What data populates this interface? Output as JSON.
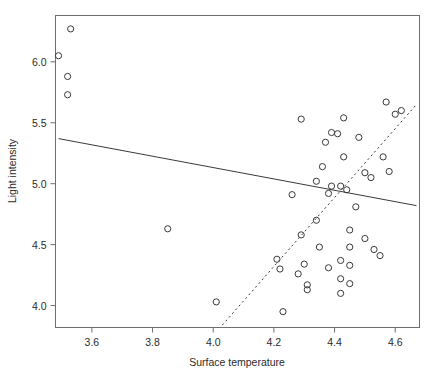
{
  "chart_data": {
    "type": "scatter",
    "title": "",
    "xlabel": "Surface temperature",
    "ylabel": "Light intensity",
    "xlim": [
      3.48,
      4.68
    ],
    "ylim": [
      3.82,
      6.38
    ],
    "xticks": [
      3.6,
      3.8,
      4.0,
      4.2,
      4.4,
      4.6
    ],
    "xtick_labels": [
      "3.6",
      "3.8",
      "4.0",
      "4.2",
      "4.4",
      "4.6"
    ],
    "yticks": [
      4.0,
      4.5,
      5.0,
      5.5,
      6.0
    ],
    "ytick_labels": [
      "4.0",
      "4.5",
      "5.0",
      "5.5",
      "6.0"
    ],
    "grid": false,
    "legend": null,
    "marker": "open-circle",
    "points": [
      {
        "x": 3.53,
        "y": 6.27
      },
      {
        "x": 3.49,
        "y": 6.05
      },
      {
        "x": 3.52,
        "y": 5.88
      },
      {
        "x": 3.52,
        "y": 5.73
      },
      {
        "x": 3.85,
        "y": 4.63
      },
      {
        "x": 4.01,
        "y": 4.03
      },
      {
        "x": 4.21,
        "y": 4.38
      },
      {
        "x": 4.22,
        "y": 4.3
      },
      {
        "x": 4.23,
        "y": 3.95
      },
      {
        "x": 4.26,
        "y": 4.91
      },
      {
        "x": 4.28,
        "y": 4.26
      },
      {
        "x": 4.29,
        "y": 5.53
      },
      {
        "x": 4.29,
        "y": 4.58
      },
      {
        "x": 4.3,
        "y": 4.34
      },
      {
        "x": 4.31,
        "y": 4.17
      },
      {
        "x": 4.31,
        "y": 4.13
      },
      {
        "x": 4.34,
        "y": 5.02
      },
      {
        "x": 4.34,
        "y": 4.7
      },
      {
        "x": 4.35,
        "y": 4.48
      },
      {
        "x": 4.36,
        "y": 5.14
      },
      {
        "x": 4.37,
        "y": 5.34
      },
      {
        "x": 4.38,
        "y": 4.92
      },
      {
        "x": 4.38,
        "y": 4.31
      },
      {
        "x": 4.39,
        "y": 5.42
      },
      {
        "x": 4.39,
        "y": 4.98
      },
      {
        "x": 4.41,
        "y": 5.41
      },
      {
        "x": 4.42,
        "y": 4.98
      },
      {
        "x": 4.42,
        "y": 4.37
      },
      {
        "x": 4.42,
        "y": 4.22
      },
      {
        "x": 4.42,
        "y": 4.1
      },
      {
        "x": 4.43,
        "y": 5.54
      },
      {
        "x": 4.43,
        "y": 5.22
      },
      {
        "x": 4.44,
        "y": 4.95
      },
      {
        "x": 4.45,
        "y": 4.62
      },
      {
        "x": 4.45,
        "y": 4.48
      },
      {
        "x": 4.45,
        "y": 4.33
      },
      {
        "x": 4.45,
        "y": 4.18
      },
      {
        "x": 4.47,
        "y": 4.81
      },
      {
        "x": 4.48,
        "y": 5.38
      },
      {
        "x": 4.5,
        "y": 5.09
      },
      {
        "x": 4.5,
        "y": 4.55
      },
      {
        "x": 4.52,
        "y": 5.05
      },
      {
        "x": 4.53,
        "y": 4.46
      },
      {
        "x": 4.55,
        "y": 4.41
      },
      {
        "x": 4.56,
        "y": 5.22
      },
      {
        "x": 4.57,
        "y": 5.67
      },
      {
        "x": 4.58,
        "y": 5.1
      },
      {
        "x": 4.6,
        "y": 5.57
      },
      {
        "x": 4.62,
        "y": 5.6
      }
    ],
    "lines": [
      {
        "name": "ols-fit",
        "style": "solid",
        "x1": 3.49,
        "y1": 5.37,
        "x2": 4.67,
        "y2": 4.82
      },
      {
        "name": "robust-fit",
        "style": "dashed",
        "x1": 4.03,
        "y1": 3.84,
        "x2": 4.67,
        "y2": 5.65
      }
    ]
  }
}
